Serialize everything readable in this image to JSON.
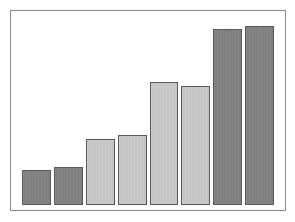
{
  "figure": {
    "background_color": "#ffffff",
    "frame_color": "#8a8a8a",
    "width_px": 295,
    "height_px": 222
  },
  "chart_data": {
    "type": "bar",
    "title": "",
    "subtitle": "",
    "xlabel": "",
    "ylabel": "",
    "categories": [
      "1",
      "2",
      "3",
      "4",
      "5",
      "6",
      "7",
      "8"
    ],
    "values": [
      36,
      39,
      68,
      73,
      128,
      123,
      183,
      186
    ],
    "ylim": [
      0,
      195
    ],
    "xlim": [
      0,
      8
    ],
    "grid": false,
    "legend": null,
    "tick_labels_x": [],
    "tick_labels_y": [],
    "annotations": [],
    "bar_colors": [
      "#828282",
      "#828282",
      "#c9c9c9",
      "#c9c9c9",
      "#c9c9c9",
      "#c9c9c9",
      "#828282",
      "#828282"
    ],
    "bar_edge_color": "#5a5a5a",
    "bars": [
      {
        "index": 1,
        "value": 36,
        "shade": "dark",
        "color": "#828282"
      },
      {
        "index": 2,
        "value": 39,
        "shade": "dark",
        "color": "#828282"
      },
      {
        "index": 3,
        "value": 68,
        "shade": "light",
        "color": "#c9c9c9"
      },
      {
        "index": 4,
        "value": 73,
        "shade": "light",
        "color": "#c9c9c9"
      },
      {
        "index": 5,
        "value": 128,
        "shade": "light",
        "color": "#c9c9c9"
      },
      {
        "index": 6,
        "value": 123,
        "shade": "light",
        "color": "#c9c9c9"
      },
      {
        "index": 7,
        "value": 183,
        "shade": "dark",
        "color": "#828282"
      },
      {
        "index": 8,
        "value": 186,
        "shade": "dark",
        "color": "#828282"
      }
    ]
  }
}
